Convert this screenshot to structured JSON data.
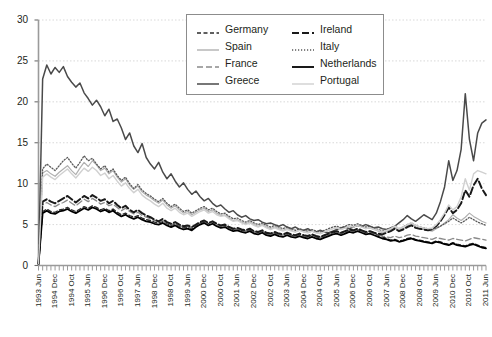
{
  "chart_data": {
    "type": "line",
    "title": "",
    "xlabel": "",
    "ylabel": "",
    "ylim": [
      0,
      30
    ],
    "yticks": [
      0,
      5,
      10,
      15,
      20,
      25,
      30
    ],
    "grid": true,
    "legend_position": "top-center",
    "xtick_labels": [
      "1993 Jun",
      "1994 Dec",
      "1994 Oct",
      "1995 Jun",
      "1996 Dec",
      "1996 Oct",
      "1997 Jun",
      "1998 Dec",
      "1998 Oct",
      "1999 Jun",
      "2000 Dec",
      "2000 Oct",
      "2001 Jun",
      "2002 Dec",
      "2002 Oct",
      "2003 Jun",
      "2004 Dec",
      "2004 Oct",
      "2005 Jun",
      "2006 Dec",
      "2006 Oct",
      "2007 Jun",
      "2008 Dec",
      "2008 Oct",
      "2009 Jun",
      "2010 Dec",
      "2010 Oct",
      "2011 Jun"
    ],
    "x_start": "1993 Jun",
    "x_end": "2011 Jun",
    "n_points": 109,
    "series": [
      {
        "name": "Germany",
        "style": "dashed",
        "color": "#2b2b2b",
        "width": 1.3,
        "dash": "4,2.5",
        "values": [
          0.2,
          6.6,
          6.9,
          6.6,
          6.5,
          6.8,
          6.9,
          7.1,
          6.8,
          6.6,
          6.9,
          7.2,
          7.0,
          7.3,
          7.1,
          6.8,
          7.0,
          6.7,
          6.9,
          6.5,
          6.2,
          6.4,
          6.1,
          5.9,
          6.1,
          5.8,
          5.6,
          5.5,
          5.3,
          5.2,
          5.4,
          5.1,
          4.9,
          5.1,
          4.8,
          4.6,
          4.7,
          4.5,
          4.9,
          5.2,
          5.4,
          5.1,
          5.3,
          5.0,
          4.8,
          4.9,
          4.6,
          4.4,
          4.5,
          4.3,
          4.2,
          4.4,
          4.1,
          4.0,
          4.2,
          3.9,
          3.8,
          4.0,
          3.8,
          3.7,
          3.9,
          3.7,
          3.6,
          3.8,
          3.6,
          3.5,
          3.7,
          3.5,
          3.4,
          3.6,
          3.8,
          4.0,
          4.1,
          3.9,
          4.1,
          4.3,
          4.2,
          4.4,
          4.2,
          4.0,
          4.1,
          3.9,
          3.7,
          3.5,
          3.3,
          3.1,
          3.2,
          3.0,
          3.1,
          3.3,
          3.4,
          3.2,
          3.1,
          3.0,
          2.9,
          2.8,
          3.0,
          2.9,
          2.7,
          2.6,
          2.8,
          2.6,
          2.5,
          2.4,
          2.6,
          2.7,
          2.5,
          2.3,
          2.2
        ]
      },
      {
        "name": "Spain",
        "style": "solid",
        "color": "#b0b0b0",
        "width": 1.2,
        "dash": "",
        "values": [
          0.2,
          11.3,
          11.6,
          11.2,
          10.9,
          11.4,
          11.8,
          12.2,
          11.6,
          11.1,
          11.9,
          12.6,
          12.1,
          12.8,
          12.3,
          11.6,
          11.9,
          11.2,
          11.6,
          10.8,
          10.2,
          10.6,
          9.8,
          9.3,
          9.7,
          9.0,
          8.6,
          8.3,
          7.9,
          7.6,
          8.0,
          7.4,
          7.0,
          7.3,
          6.8,
          6.4,
          6.6,
          6.2,
          6.5,
          6.8,
          7.0,
          6.6,
          6.8,
          6.4,
          6.1,
          6.2,
          5.8,
          5.5,
          5.6,
          5.3,
          5.1,
          5.3,
          5.0,
          4.8,
          5.0,
          4.7,
          4.5,
          4.7,
          4.5,
          4.3,
          4.5,
          4.3,
          4.1,
          4.3,
          4.1,
          4.0,
          4.2,
          4.0,
          3.9,
          4.1,
          4.3,
          4.5,
          4.6,
          4.4,
          4.6,
          4.8,
          4.7,
          4.9,
          4.7,
          4.5,
          4.6,
          4.4,
          4.2,
          4.0,
          4.2,
          4.4,
          4.6,
          4.3,
          4.5,
          4.8,
          5.0,
          4.7,
          4.5,
          4.4,
          4.3,
          4.2,
          4.5,
          4.8,
          5.2,
          5.6,
          6.2,
          5.8,
          5.5,
          5.9,
          6.4,
          6.0,
          5.7,
          5.4,
          5.2
        ]
      },
      {
        "name": "France",
        "style": "dashed",
        "color": "#8a8a8a",
        "width": 1.3,
        "dash": "6,3",
        "values": [
          0.2,
          7.4,
          7.7,
          7.4,
          7.2,
          7.5,
          7.7,
          8.0,
          7.6,
          7.3,
          7.7,
          8.1,
          7.8,
          8.2,
          7.9,
          7.5,
          7.7,
          7.3,
          7.5,
          7.1,
          6.7,
          7.0,
          6.6,
          6.3,
          6.5,
          6.1,
          5.9,
          5.7,
          5.5,
          5.3,
          5.5,
          5.2,
          5.0,
          5.2,
          4.9,
          4.7,
          4.8,
          4.6,
          4.9,
          5.2,
          5.4,
          5.1,
          5.3,
          5.0,
          4.8,
          4.9,
          4.6,
          4.4,
          4.5,
          4.3,
          4.2,
          4.4,
          4.1,
          4.0,
          4.2,
          3.9,
          3.8,
          4.0,
          3.8,
          3.7,
          3.9,
          3.7,
          3.6,
          3.8,
          3.6,
          3.5,
          3.7,
          3.5,
          3.4,
          3.6,
          3.8,
          4.0,
          4.1,
          3.9,
          4.1,
          4.3,
          4.2,
          4.4,
          4.2,
          4.0,
          4.1,
          3.9,
          3.8,
          3.6,
          3.5,
          3.4,
          3.6,
          3.4,
          3.5,
          3.7,
          3.8,
          3.6,
          3.5,
          3.4,
          3.3,
          3.2,
          3.4,
          3.3,
          3.2,
          3.1,
          3.3,
          3.2,
          3.1,
          3.0,
          3.2,
          3.4,
          3.3,
          3.2,
          3.1
        ]
      },
      {
        "name": "Greece",
        "style": "solid",
        "color": "#4a4a4a",
        "width": 1.5,
        "dash": "",
        "values": [
          0.2,
          22.8,
          24.5,
          23.4,
          24.2,
          23.6,
          24.3,
          23.1,
          22.4,
          21.8,
          22.3,
          21.1,
          20.4,
          19.6,
          20.2,
          19.4,
          18.3,
          19.1,
          17.6,
          17.9,
          16.8,
          15.4,
          16.2,
          14.6,
          13.8,
          14.9,
          13.2,
          12.4,
          11.8,
          12.6,
          11.4,
          10.6,
          11.2,
          10.3,
          9.6,
          10.1,
          9.3,
          8.7,
          9.1,
          8.4,
          7.9,
          8.2,
          7.6,
          7.2,
          7.4,
          6.9,
          6.5,
          6.7,
          6.2,
          5.9,
          6.1,
          5.7,
          5.5,
          5.6,
          5.3,
          5.1,
          5.2,
          5.0,
          4.8,
          5.0,
          4.7,
          4.5,
          4.7,
          4.4,
          4.3,
          4.5,
          4.2,
          4.1,
          4.3,
          4.1,
          4.0,
          4.2,
          4.4,
          4.6,
          4.7,
          4.5,
          4.7,
          4.9,
          4.8,
          5.0,
          4.8,
          4.6,
          4.7,
          4.5,
          4.4,
          4.6,
          4.8,
          5.2,
          5.6,
          6.1,
          5.7,
          5.4,
          5.8,
          6.2,
          5.9,
          5.6,
          6.4,
          7.8,
          9.6,
          12.8,
          10.4,
          11.6,
          14.2,
          21.0,
          15.4,
          12.8,
          16.2,
          17.4,
          17.8
        ]
      },
      {
        "name": "Ireland",
        "style": "dashed",
        "color": "#1a1a1a",
        "width": 2.0,
        "dash": "7,3",
        "values": [
          0.2,
          7.8,
          8.1,
          7.8,
          7.6,
          7.9,
          8.2,
          8.5,
          8.1,
          7.7,
          8.1,
          8.5,
          8.2,
          8.6,
          8.3,
          7.9,
          8.1,
          7.6,
          7.9,
          7.4,
          7.0,
          7.3,
          6.8,
          6.5,
          6.8,
          6.4,
          6.1,
          5.9,
          5.6,
          5.4,
          5.7,
          5.3,
          5.1,
          5.3,
          5.0,
          4.8,
          4.9,
          4.7,
          5.0,
          5.3,
          5.5,
          5.2,
          5.4,
          5.1,
          4.9,
          5.0,
          4.7,
          4.5,
          4.6,
          4.4,
          4.3,
          4.5,
          4.2,
          4.1,
          4.3,
          4.0,
          3.9,
          4.1,
          3.9,
          3.8,
          4.0,
          3.8,
          3.7,
          3.9,
          3.7,
          3.6,
          3.8,
          3.6,
          3.5,
          3.7,
          3.9,
          4.1,
          4.2,
          4.0,
          4.2,
          4.4,
          4.3,
          4.5,
          4.3,
          4.1,
          4.2,
          4.0,
          3.9,
          3.8,
          4.0,
          4.2,
          4.5,
          4.2,
          4.4,
          4.7,
          4.9,
          4.6,
          4.5,
          4.4,
          4.3,
          4.4,
          4.8,
          5.4,
          6.2,
          7.1,
          6.4,
          6.8,
          7.6,
          9.2,
          8.4,
          9.8,
          10.6,
          9.4,
          8.6
        ]
      },
      {
        "name": "Italy",
        "style": "dotted",
        "color": "#5a5a5a",
        "width": 1.3,
        "dash": "1.2,1.8",
        "values": [
          0.2,
          11.8,
          12.4,
          12.0,
          11.6,
          12.2,
          12.8,
          13.2,
          12.5,
          11.9,
          12.6,
          13.4,
          12.8,
          13.1,
          12.4,
          11.8,
          12.2,
          11.4,
          11.8,
          11.0,
          10.4,
          10.8,
          10.0,
          9.4,
          9.9,
          9.2,
          8.8,
          8.5,
          8.1,
          7.8,
          8.2,
          7.6,
          7.2,
          7.5,
          7.0,
          6.6,
          6.8,
          6.4,
          6.7,
          7.0,
          7.2,
          6.8,
          7.0,
          6.6,
          6.3,
          6.4,
          6.0,
          5.7,
          5.8,
          5.5,
          5.3,
          5.5,
          5.2,
          5.0,
          5.2,
          4.9,
          4.7,
          4.9,
          4.7,
          4.5,
          4.7,
          4.5,
          4.3,
          4.5,
          4.3,
          4.2,
          4.4,
          4.2,
          4.1,
          4.3,
          4.5,
          4.7,
          4.8,
          4.6,
          4.8,
          5.0,
          4.9,
          5.1,
          4.9,
          4.7,
          4.8,
          4.6,
          4.4,
          4.2,
          4.4,
          4.6,
          4.8,
          4.5,
          4.7,
          5.0,
          5.2,
          4.9,
          4.7,
          4.6,
          4.5,
          4.4,
          4.6,
          4.8,
          5.1,
          5.4,
          5.8,
          5.5,
          5.2,
          5.5,
          5.9,
          5.6,
          5.3,
          5.1,
          4.9
        ]
      },
      {
        "name": "Netherlands",
        "style": "solid",
        "color": "#000000",
        "width": 1.8,
        "dash": "",
        "values": [
          0.2,
          6.4,
          6.7,
          6.4,
          6.3,
          6.6,
          6.7,
          6.9,
          6.6,
          6.4,
          6.7,
          7.0,
          6.8,
          7.1,
          6.9,
          6.6,
          6.8,
          6.5,
          6.7,
          6.3,
          6.0,
          6.2,
          5.9,
          5.7,
          5.9,
          5.6,
          5.4,
          5.3,
          5.1,
          5.0,
          5.2,
          4.9,
          4.7,
          4.9,
          4.6,
          4.4,
          4.5,
          4.3,
          4.7,
          5.0,
          5.2,
          4.9,
          5.1,
          4.8,
          4.6,
          4.7,
          4.4,
          4.2,
          4.3,
          4.1,
          4.0,
          4.2,
          3.9,
          3.8,
          4.0,
          3.7,
          3.6,
          3.8,
          3.6,
          3.5,
          3.7,
          3.5,
          3.4,
          3.6,
          3.4,
          3.3,
          3.5,
          3.3,
          3.2,
          3.4,
          3.6,
          3.8,
          3.9,
          3.7,
          3.9,
          4.1,
          4.0,
          4.2,
          4.0,
          3.8,
          3.9,
          3.7,
          3.5,
          3.3,
          3.2,
          3.0,
          3.1,
          2.9,
          3.0,
          3.2,
          3.3,
          3.1,
          3.0,
          2.9,
          2.8,
          2.7,
          2.9,
          2.8,
          2.6,
          2.5,
          2.7,
          2.5,
          2.4,
          2.3,
          2.5,
          2.6,
          2.4,
          2.2,
          2.1
        ]
      },
      {
        "name": "Portugal",
        "style": "solid",
        "color": "#d0d0d0",
        "width": 1.4,
        "dash": "",
        "values": [
          0.2,
          10.8,
          11.2,
          10.8,
          10.5,
          11.0,
          11.4,
          11.8,
          11.2,
          10.7,
          11.3,
          11.9,
          11.5,
          12.0,
          11.6,
          11.0,
          11.3,
          10.6,
          11.0,
          10.3,
          9.7,
          10.1,
          9.4,
          8.9,
          9.3,
          8.6,
          8.2,
          7.9,
          7.5,
          7.2,
          7.6,
          7.0,
          6.7,
          7.0,
          6.5,
          6.2,
          6.4,
          6.0,
          6.3,
          6.6,
          6.8,
          6.4,
          6.6,
          6.2,
          6.0,
          6.1,
          5.7,
          5.4,
          5.5,
          5.2,
          5.0,
          5.2,
          4.9,
          4.7,
          4.9,
          4.6,
          4.4,
          4.6,
          4.4,
          4.2,
          4.4,
          4.2,
          4.1,
          4.3,
          4.1,
          4.0,
          4.2,
          4.0,
          3.9,
          4.1,
          4.3,
          4.5,
          4.6,
          4.4,
          4.6,
          4.8,
          4.7,
          4.9,
          4.7,
          4.5,
          4.6,
          4.4,
          4.3,
          4.1,
          4.3,
          4.5,
          4.8,
          4.5,
          4.7,
          5.0,
          5.2,
          4.9,
          4.7,
          4.6,
          4.5,
          4.6,
          5.0,
          5.6,
          6.4,
          7.4,
          6.8,
          7.2,
          8.4,
          10.6,
          9.2,
          11.2,
          11.6,
          11.4,
          11.2
        ]
      }
    ]
  },
  "legend": {
    "items": [
      {
        "label": "Germany"
      },
      {
        "label": "Spain"
      },
      {
        "label": "France"
      },
      {
        "label": "Greece"
      },
      {
        "label": "Ireland"
      },
      {
        "label": "Italy"
      },
      {
        "label": "Netherlands"
      },
      {
        "label": "Portugal"
      }
    ]
  }
}
